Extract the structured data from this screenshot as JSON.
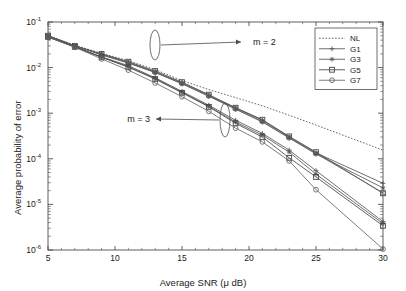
{
  "figure": {
    "background": "#ffffff",
    "axis_color": "#4d4d4d",
    "text_color": "#1a1a1a"
  },
  "chart_data": {
    "type": "line",
    "title": "",
    "subtitle": "",
    "xlabel": "Average SNR (μ dB)",
    "ylabel": "Average probability of error",
    "xscale": "linear",
    "yscale": "log",
    "xlim": [
      5,
      30
    ],
    "ylim": [
      1e-06,
      0.1
    ],
    "xticks": [
      5,
      10,
      15,
      20,
      25,
      30
    ],
    "xticklabels": [
      "5",
      "10",
      "15",
      "20",
      "25",
      "30"
    ],
    "yticks": [
      1e-06,
      1e-05,
      0.0001,
      0.001,
      0.01,
      0.1
    ],
    "yticklabels": [
      "10-6",
      "10-5",
      "10-4",
      "10-3",
      "10-2",
      "10-1"
    ],
    "ytick_exponents": [
      "-6",
      "-5",
      "-4",
      "-3",
      "-2",
      "-1"
    ],
    "ytick_base": "10",
    "grid": false,
    "minor_ticks": true,
    "legend_position": "top-right",
    "legend_entries": [
      {
        "name": "NL",
        "marker": "none",
        "linestyle": "dotted",
        "color": "#4d4d4d"
      },
      {
        "name": "G1",
        "marker": "plus",
        "linestyle": "solid",
        "color": "#555555"
      },
      {
        "name": "G3",
        "marker": "star",
        "linestyle": "solid",
        "color": "#555555"
      },
      {
        "name": "G5",
        "marker": "square",
        "linestyle": "solid",
        "color": "#444444"
      },
      {
        "name": "G7",
        "marker": "circle",
        "linestyle": "solid",
        "color": "#666666"
      }
    ],
    "x": [
      5,
      7,
      9,
      11,
      13,
      15,
      17,
      19,
      21,
      23,
      25,
      30
    ],
    "series": [
      {
        "name": "NL",
        "group": "m = 2",
        "marker": "none",
        "values": [
          0.05,
          0.031,
          0.0205,
          0.0142,
          0.009,
          0.0052,
          0.0033,
          0.0022,
          0.00145,
          0.0009,
          0.00055,
          0.000155
        ]
      },
      {
        "name": "G1",
        "group": "m = 2",
        "marker": "plus",
        "values": [
          0.05,
          0.03,
          0.0195,
          0.013,
          0.008,
          0.0046,
          0.00245,
          0.0013,
          0.0007,
          0.0003,
          0.000135,
          2.9e-05
        ]
      },
      {
        "name": "G3",
        "group": "m = 2",
        "marker": "star",
        "values": [
          0.05,
          0.03,
          0.019,
          0.0125,
          0.0078,
          0.0044,
          0.00235,
          0.00122,
          0.00064,
          0.000285,
          0.000128,
          2.3e-05
        ]
      },
      {
        "name": "G5",
        "group": "m = 2",
        "marker": "square",
        "values": [
          0.05,
          0.03,
          0.02,
          0.0135,
          0.0084,
          0.0048,
          0.00255,
          0.00132,
          0.00072,
          0.00031,
          0.00014,
          1.75e-05
        ]
      },
      {
        "name": "G7",
        "group": "m = 2",
        "marker": "circle",
        "values": [
          0.05,
          0.03,
          0.0192,
          0.0128,
          0.0079,
          0.0045,
          0.0024,
          0.00125,
          0.00066,
          0.00029,
          0.00013,
          1.8e-05
        ]
      },
      {
        "name": "G1",
        "group": "m = 3",
        "marker": "plus",
        "values": [
          0.047,
          0.0285,
          0.0172,
          0.011,
          0.006,
          0.003,
          0.0015,
          0.0007,
          0.00036,
          0.000155,
          5.5e-05,
          4.2e-06
        ]
      },
      {
        "name": "G3",
        "group": "m = 3",
        "marker": "star",
        "values": [
          0.047,
          0.0285,
          0.017,
          0.0105,
          0.0058,
          0.0029,
          0.00142,
          0.00064,
          0.00033,
          0.00014,
          4.6e-05,
          3.8e-06
        ]
      },
      {
        "name": "G5",
        "group": "m = 3",
        "marker": "square",
        "values": [
          0.047,
          0.0285,
          0.0168,
          0.0102,
          0.0056,
          0.0028,
          0.00138,
          0.0006,
          0.0003,
          0.000105,
          4e-05,
          3.4e-06
        ]
      },
      {
        "name": "G7",
        "group": "m = 3",
        "marker": "circle",
        "values": [
          0.047,
          0.028,
          0.0155,
          0.0088,
          0.0046,
          0.0023,
          0.0011,
          0.00047,
          0.000235,
          9e-05,
          2.1e-05,
          1.05e-06
        ]
      }
    ],
    "annotations": [
      {
        "text": "m = 2",
        "label_x": 253,
        "label_y": 45,
        "arrow_dir": "right",
        "ellipse_cx": 155,
        "ellipse_cy": 45,
        "ellipse_rx": 5,
        "ellipse_ry": 15
      },
      {
        "text": "m = 3",
        "label_x": 150,
        "label_y": 122,
        "arrow_dir": "left",
        "ellipse_cx": 225,
        "ellipse_cy": 120,
        "ellipse_rx": 5,
        "ellipse_ry": 17
      }
    ]
  }
}
